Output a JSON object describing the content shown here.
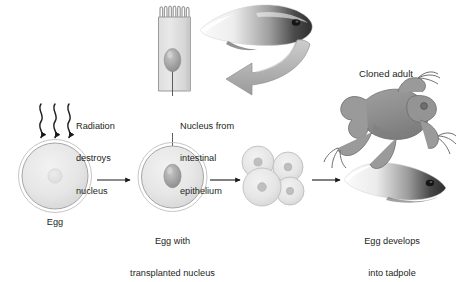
{
  "figure": {
    "background_color": "#ffffff",
    "ink_color": "#231f20",
    "cell_fill": "#e3e3e3",
    "cell_stroke": "#9a9a9a",
    "nucleus_fill": "#b9b9b9",
    "arrow_gray": "#a9a9a9",
    "animal_gray": "#8c8c8c"
  },
  "labels": {
    "radiation": "Radiation\ndestroys\nnucleus",
    "radiation_line1": "Radiation",
    "radiation_line2": "destroys",
    "radiation_line3": "nucleus",
    "nucleus_source_line1": "Nucleus from",
    "nucleus_source_line2": "intestinal",
    "nucleus_source_line3": "epithelium",
    "egg": "Egg",
    "egg_transplanted_line1": "Egg with",
    "egg_transplanted_line2": "transplanted nucleus",
    "cloned_adult": "Cloned adult",
    "develops_line1": "Egg develops",
    "develops_line2": "into tadpole"
  },
  "stages": [
    {
      "id": "donor-epithelial-cell",
      "label": "Nucleus from intestinal epithelium",
      "order": 1
    },
    {
      "id": "egg",
      "label": "Egg",
      "order": 2
    },
    {
      "id": "egg-with-transplanted-nucleus",
      "label": "Egg with transplanted nucleus",
      "order": 3
    },
    {
      "id": "embryo-cleavage",
      "label": "",
      "order": 4
    },
    {
      "id": "tadpole",
      "label": "Egg develops into tadpole",
      "order": 5
    },
    {
      "id": "cloned-adult-frog",
      "label": "Cloned adult",
      "order": 6
    }
  ],
  "counts": {
    "radiation_rays": 3,
    "embryo_cells": 4,
    "microvilli": 7
  }
}
